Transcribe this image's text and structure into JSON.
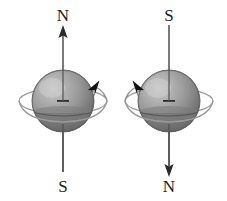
{
  "figure": {
    "background_color": "#ffffff",
    "axis_color": "#4a4a4a",
    "arrow_color": "#111111",
    "sphere_light": "#b4b4b4",
    "sphere_mid": "#8e8e8e",
    "sphere_dark": "#5a5a5a",
    "sphere_shadow": "#4a4a4a",
    "label_color": "#1a1a1a",
    "orbit_color": "#8a8a8a"
  },
  "spheres": [
    {
      "id": "left-sphere",
      "name": "left-dipole",
      "top_label": "N",
      "bottom_label": "S",
      "axis_arrow_direction": "up",
      "spin_direction": "counterclockwise-from-north",
      "spin_arrowhead_side": "right",
      "center_x": 63,
      "center_y": 101,
      "radius": 31
    },
    {
      "id": "right-sphere",
      "name": "right-dipole",
      "top_label": "S",
      "bottom_label": "N",
      "axis_arrow_direction": "down",
      "spin_direction": "clockwise-from-north",
      "spin_arrowhead_side": "left",
      "center_x": 169,
      "center_y": 101,
      "radius": 31
    }
  ],
  "labels": {
    "left_top": "N",
    "left_bottom": "S",
    "right_top": "S",
    "right_bottom": "N"
  }
}
